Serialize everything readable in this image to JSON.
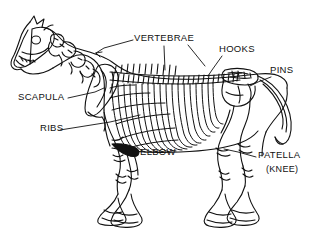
{
  "figure": {
    "background_color": "#ffffff",
    "line_color": "#111111",
    "style": "black-and-white line illustration"
  },
  "labels": [
    {
      "id": "vertebrae",
      "text": "VERTEBRAE",
      "x": 134,
      "y": 41
    },
    {
      "id": "hooks",
      "text": "HOOKS",
      "x": 219,
      "y": 52
    },
    {
      "id": "pins",
      "text": "PINS",
      "x": 270,
      "y": 73
    },
    {
      "id": "scapula",
      "text": "SCAPULA",
      "x": 18,
      "y": 100
    },
    {
      "id": "ribs",
      "text": "RIBS",
      "x": 40,
      "y": 131
    },
    {
      "id": "elbow",
      "text": "ELBOW",
      "x": 140,
      "y": 155
    },
    {
      "id": "patella",
      "text": "PATELLA",
      "x": 258,
      "y": 158
    },
    {
      "id": "knee",
      "text": "(KNEE)",
      "x": 266,
      "y": 172
    }
  ],
  "parts": [
    {
      "id": "skull",
      "name": "skull"
    },
    {
      "id": "cervical-spine",
      "name": "cervical vertebrae"
    },
    {
      "id": "thoracic-spine",
      "name": "thoracic vertebrae"
    },
    {
      "id": "ribcage",
      "name": "ribs"
    },
    {
      "id": "scapula-bone",
      "name": "scapula"
    },
    {
      "id": "pelvis",
      "name": "pelvis with hooks and pins"
    },
    {
      "id": "tail",
      "name": "caudal vertebrae"
    },
    {
      "id": "foreleg-near",
      "name": "near foreleg"
    },
    {
      "id": "foreleg-far",
      "name": "far foreleg"
    },
    {
      "id": "hindleg-near",
      "name": "near hind leg"
    },
    {
      "id": "hindleg-far",
      "name": "far hind leg"
    }
  ]
}
